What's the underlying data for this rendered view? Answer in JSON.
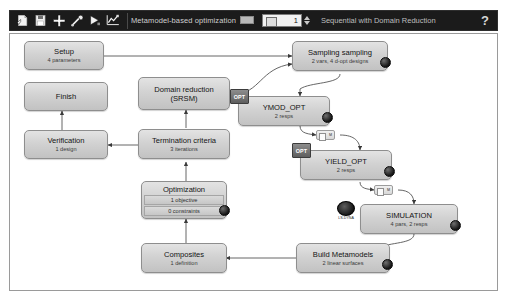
{
  "toolbar": {
    "icons": [
      {
        "name": "new-file-icon",
        "glyph": "new"
      },
      {
        "name": "save-icon",
        "glyph": "save"
      },
      {
        "name": "add-icon",
        "glyph": "plus"
      },
      {
        "name": "tools-icon",
        "glyph": "tools"
      },
      {
        "name": "run-icon",
        "glyph": "play"
      },
      {
        "name": "chart-icon",
        "glyph": "chart"
      }
    ],
    "task_label": "Metamodel-based optimization",
    "iteration_value": "1",
    "strategy_label": "Sequential with Domain Reduction",
    "help_label": "?"
  },
  "flow": {
    "nodes": [
      {
        "id": "setup",
        "title": "Setup",
        "sub": "4 parameters",
        "badge": null,
        "dot": false,
        "rows": []
      },
      {
        "id": "sampling",
        "title": "Sampling sampling",
        "sub": "2 vars, 4 d-opt designs",
        "badge": null,
        "dot": true,
        "rows": []
      },
      {
        "id": "ymod_opt",
        "title": "YMOD_OPT",
        "sub": "2 resps",
        "badge": "OPT",
        "dot": true,
        "rows": []
      },
      {
        "id": "yield_opt",
        "title": "YIELD_OPT",
        "sub": "2 resps",
        "badge": "OPT",
        "dot": true,
        "rows": []
      },
      {
        "id": "simulation",
        "title": "SIMULATION",
        "sub": "4 pars, 2 resps",
        "badge": "LS-DYNA",
        "dot": true,
        "rows": []
      },
      {
        "id": "build_metamodels",
        "title": "Build Metamodels",
        "sub": "2 linear surfaces",
        "badge": null,
        "dot": true,
        "rows": []
      },
      {
        "id": "composites",
        "title": "Composites",
        "sub": "1 definition",
        "badge": null,
        "dot": false,
        "rows": []
      },
      {
        "id": "optimization",
        "title": "Optimization",
        "sub": "",
        "badge": null,
        "dot": true,
        "rows": [
          "1 objective",
          "0 constraints"
        ]
      },
      {
        "id": "termination",
        "title": "Termination criteria",
        "sub": "3 iterations",
        "badge": null,
        "dot": false,
        "rows": []
      },
      {
        "id": "domain_reduction",
        "title": "Domain reduction",
        "sub": "(SRSM)",
        "badge": null,
        "dot": false,
        "rows": []
      },
      {
        "id": "verification",
        "title": "Verification",
        "sub": "1 design",
        "badge": null,
        "dot": false,
        "rows": []
      },
      {
        "id": "finish",
        "title": "Finish",
        "sub": "",
        "badge": null,
        "dot": false,
        "rows": []
      }
    ],
    "connectors": [
      {
        "id": "conn-ymod-yield",
        "label": "M"
      },
      {
        "id": "conn-yield-sim",
        "label": "M"
      }
    ]
  }
}
